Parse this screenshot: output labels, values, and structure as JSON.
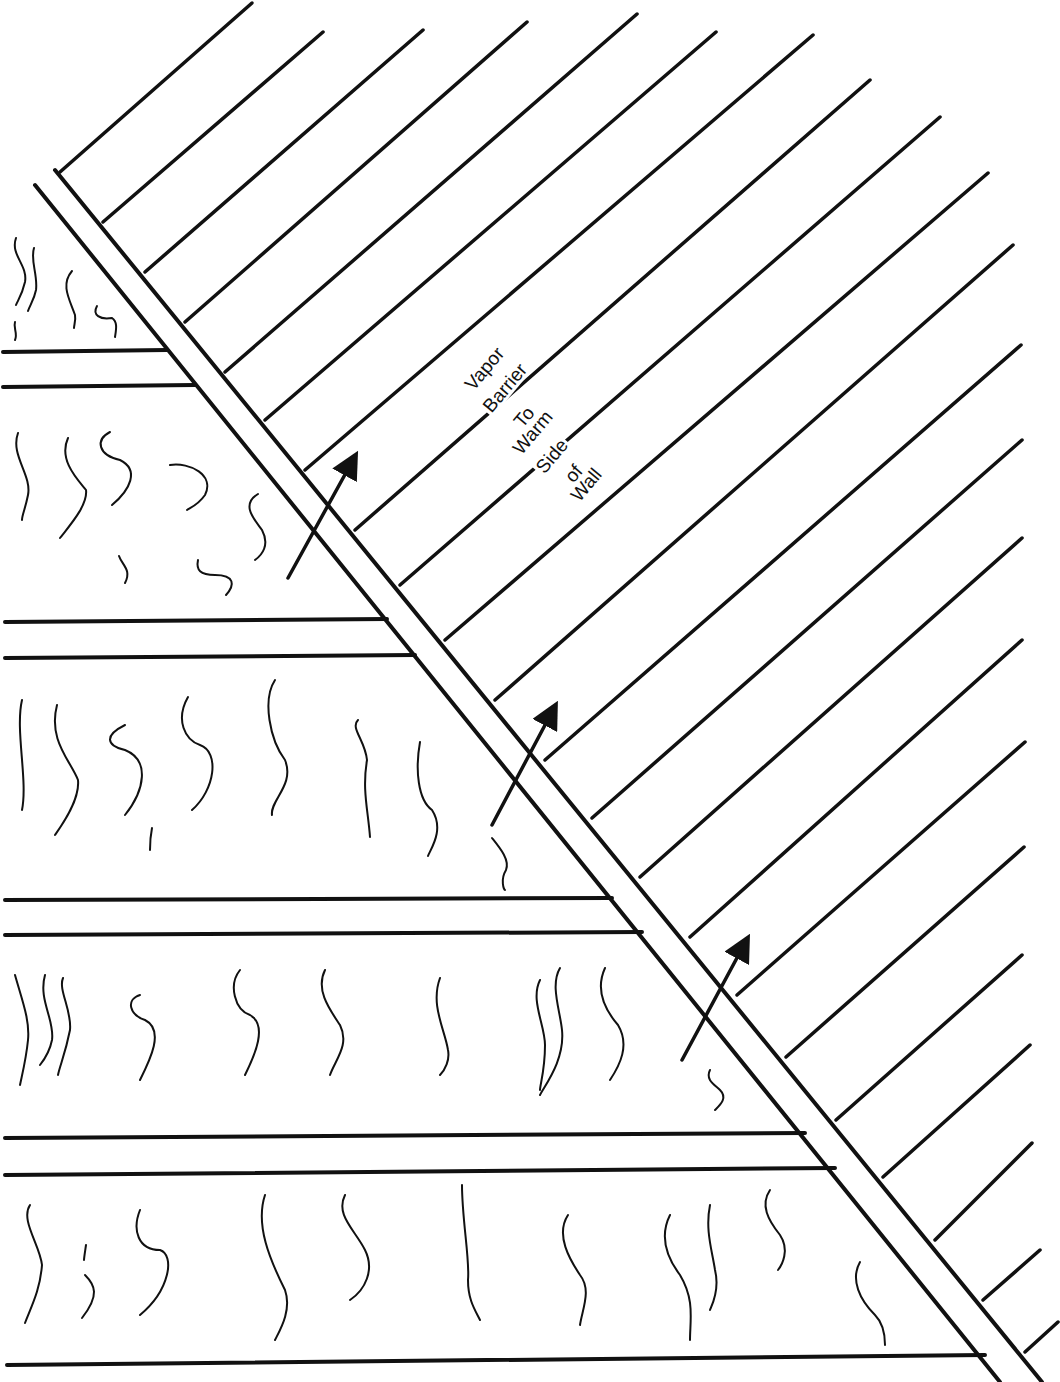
{
  "diagram": {
    "colors": {
      "line": "#111111",
      "background": "#ffffff"
    },
    "label": {
      "words": [
        "Vapor",
        "Barrier",
        "To",
        "Warm",
        "Side",
        "of",
        "Wall"
      ],
      "positions": [
        {
          "x": 460,
          "y": 383
        },
        {
          "x": 478,
          "y": 405
        },
        {
          "x": 509,
          "y": 420
        },
        {
          "x": 508,
          "y": 447
        },
        {
          "x": 531,
          "y": 466
        },
        {
          "x": 560,
          "y": 475
        },
        {
          "x": 566,
          "y": 494
        }
      ],
      "rotation_deg": -50
    },
    "barrier": {
      "outer_line": {
        "x1": 35,
        "y1": 185,
        "x2": 1000,
        "y2": 1382
      },
      "inner_line": {
        "x1": 55,
        "y1": 170,
        "x2": 1042,
        "y2": 1382
      },
      "top_tick": {
        "x1": 55,
        "y1": 170,
        "x2": 62,
        "y2": 165
      }
    },
    "hatch_lines": [
      {
        "x1": 60,
        "y1": 172,
        "x2": 252,
        "y2": 3
      },
      {
        "x1": 103,
        "y1": 222,
        "x2": 323,
        "y2": 32
      },
      {
        "x1": 145,
        "y1": 272,
        "x2": 423,
        "y2": 30
      },
      {
        "x1": 185,
        "y1": 322,
        "x2": 527,
        "y2": 22
      },
      {
        "x1": 225,
        "y1": 372,
        "x2": 637,
        "y2": 14
      },
      {
        "x1": 265,
        "y1": 420,
        "x2": 716,
        "y2": 32
      },
      {
        "x1": 305,
        "y1": 470,
        "x2": 813,
        "y2": 35
      },
      {
        "x1": 355,
        "y1": 530,
        "x2": 870,
        "y2": 80
      },
      {
        "x1": 400,
        "y1": 585,
        "x2": 940,
        "y2": 117
      },
      {
        "x1": 445,
        "y1": 640,
        "x2": 988,
        "y2": 173
      },
      {
        "x1": 495,
        "y1": 700,
        "x2": 1013,
        "y2": 245
      },
      {
        "x1": 545,
        "y1": 760,
        "x2": 1021,
        "y2": 345
      },
      {
        "x1": 592,
        "y1": 818,
        "x2": 1022,
        "y2": 440
      },
      {
        "x1": 640,
        "y1": 877,
        "x2": 1022,
        "y2": 538
      },
      {
        "x1": 690,
        "y1": 937,
        "x2": 1022,
        "y2": 640
      },
      {
        "x1": 737,
        "y1": 995,
        "x2": 1025,
        "y2": 742
      },
      {
        "x1": 786,
        "y1": 1057,
        "x2": 1024,
        "y2": 847
      },
      {
        "x1": 836,
        "y1": 1120,
        "x2": 1022,
        "y2": 955
      },
      {
        "x1": 883,
        "y1": 1177,
        "x2": 1030,
        "y2": 1045
      },
      {
        "x1": 935,
        "y1": 1240,
        "x2": 1032,
        "y2": 1143
      },
      {
        "x1": 983,
        "y1": 1300,
        "x2": 1040,
        "y2": 1250
      },
      {
        "x1": 1025,
        "y1": 1352,
        "x2": 1058,
        "y2": 1322
      }
    ],
    "horizontal_lines": [
      {
        "x1": 3,
        "y1": 352,
        "x2": 167,
        "y2": 350
      },
      {
        "x1": 3,
        "y1": 387,
        "x2": 195,
        "y2": 385
      },
      {
        "x1": 5,
        "y1": 622,
        "x2": 387,
        "y2": 619
      },
      {
        "x1": 5,
        "y1": 658,
        "x2": 415,
        "y2": 655
      },
      {
        "x1": 5,
        "y1": 900,
        "x2": 612,
        "y2": 898
      },
      {
        "x1": 5,
        "y1": 935,
        "x2": 642,
        "y2": 932
      },
      {
        "x1": 5,
        "y1": 1138,
        "x2": 805,
        "y2": 1133
      },
      {
        "x1": 5,
        "y1": 1175,
        "x2": 835,
        "y2": 1168
      },
      {
        "x1": 7,
        "y1": 1365,
        "x2": 985,
        "y2": 1355
      }
    ],
    "arrows": [
      {
        "x1": 288,
        "y1": 578,
        "x2": 353,
        "y2": 460
      },
      {
        "x1": 492,
        "y1": 825,
        "x2": 553,
        "y2": 710
      },
      {
        "x1": 682,
        "y1": 1060,
        "x2": 745,
        "y2": 943
      }
    ],
    "insulation_squiggles": [
      "M16,238 C10,255 28,265 25,282 C22,295 18,300 16,305",
      "M34,248 C30,260 38,275 36,290 C34,300 30,305 28,311",
      "M72,271 C60,285 70,300 75,315 C76,320 74,325 74,328",
      "M97,306 C92,315 100,320 112,318 C118,322 116,330 115,337",
      "M15,322 C13,328 18,333 15,340",
      "M18,433 C10,455 32,475 28,495 C25,510 22,515 22,520",
      "M68,438 C58,460 78,480 86,490 C88,505 70,525 60,538",
      "M110,432 C95,440 98,455 120,460 C140,470 130,490 112,505",
      "M170,465 C190,462 215,475 205,495 C198,505 190,508 187,510",
      "M258,494 C240,505 255,520 262,530 C270,545 262,555 255,560",
      "M119,556 C122,565 132,570 125,583",
      "M198,560 C196,570 200,575 215,575 C235,575 235,585 226,595",
      "M22,700 C15,730 28,780 22,810",
      "M57,705 C48,740 70,760 78,780 C80,800 62,825 55,835",
      "M125,725 C105,735 105,745 125,750 C150,760 145,790 125,815",
      "M152,828 C150,838 150,845 150,850",
      "M188,697 C175,720 185,740 200,745 C220,752 215,790 192,810",
      "M275,680 C262,700 270,740 285,760 C295,785 270,800 272,815",
      "M358,720 C350,728 365,740 367,760 C362,790 368,810 370,837",
      "M420,742 C415,770 418,800 432,810 C445,830 430,850 428,856",
      "M492,838 C500,848 510,860 506,870 C500,880 504,890 505,890",
      "M15,975 C22,1000 30,1020 28,1040 C26,1060 22,1075 20,1085",
      "M45,975 C38,1000 55,1020 52,1040 C50,1050 44,1060 40,1065",
      "M63,978 C58,990 72,1010 70,1030 C65,1055 60,1065 58,1075",
      "M140,995 C125,1000 130,1015 145,1020 C165,1030 150,1060 140,1080",
      "M240,970 C228,985 235,1010 250,1015 C268,1025 255,1055 245,1075",
      "M325,970 C315,990 330,1010 340,1025 C350,1045 335,1060 330,1075",
      "M440,978 C430,1005 445,1030 448,1050 C450,1060 445,1070 440,1075",
      "M540,980 C530,1000 545,1025 545,1045 C545,1070 540,1085 540,1090",
      "M560,968 C550,985 560,1010 562,1030 C565,1060 545,1085 540,1095",
      "M605,968 C595,990 605,1010 618,1025 C630,1045 620,1065 610,1080",
      "M710,1070 C705,1080 715,1085 720,1090 C728,1098 720,1105 715,1110",
      "M30,1205 C20,1220 40,1245 42,1265 C40,1290 32,1305 25,1323",
      "M86,1245 C85,1252 84,1258 84,1260",
      "M85,1275 C95,1285 100,1295 82,1318",
      "M140,1210 C132,1230 138,1250 160,1250 C175,1255 170,1290 140,1315",
      "M265,1195 C255,1225 270,1260 285,1290 C292,1310 280,1330 275,1340",
      "M345,1195 C335,1215 355,1230 365,1250 C375,1270 365,1290 350,1300",
      "M462,1185 C462,1220 470,1260 468,1280 C468,1300 475,1310 480,1320",
      "M568,1215 C555,1235 570,1260 580,1275 C592,1290 582,1310 580,1325",
      "M670,1215 C660,1235 665,1255 680,1275 C695,1300 690,1320 690,1340",
      "M710,1205 C705,1230 712,1250 715,1270 C720,1290 712,1305 710,1310",
      "M770,1190 C760,1205 768,1220 780,1235 C790,1250 782,1265 778,1270",
      "M860,1262 C850,1280 860,1300 875,1315 C885,1325 885,1340 885,1345"
    ]
  }
}
